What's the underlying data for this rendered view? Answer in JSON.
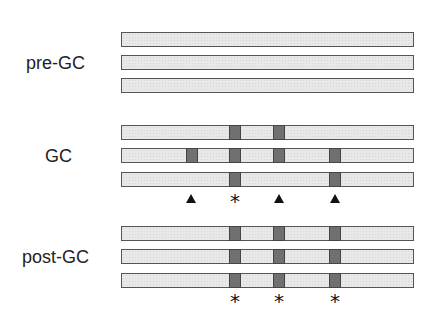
{
  "diagram": {
    "bar_x_range": [
      121,
      414
    ],
    "colors": {
      "bar_fill": "#e8e8e8",
      "bar_border": "#555555",
      "segment_fill": "#707070",
      "segment_border": "#444444",
      "marker": "#111111"
    },
    "groups": [
      {
        "label": "pre-GC",
        "label_pos": {
          "x": 26,
          "y": 53
        },
        "rows": [
          {
            "y": 32,
            "segments": []
          },
          {
            "y": 55,
            "segments": []
          },
          {
            "y": 78,
            "segments": []
          }
        ],
        "markers": []
      },
      {
        "label": "GC",
        "label_pos": {
          "x": 45,
          "y": 146
        },
        "rows": [
          {
            "y": 125,
            "segments": [
              229,
              273
            ]
          },
          {
            "y": 148,
            "segments": [
              186,
              229,
              273,
              329
            ]
          },
          {
            "y": 172,
            "segments": [
              229,
              329
            ]
          }
        ],
        "markers": [
          {
            "type": "triangle",
            "x": 191,
            "y": 194,
            "symbol": "▲"
          },
          {
            "type": "asterisk",
            "x": 235,
            "y": 193,
            "symbol": "*"
          },
          {
            "type": "triangle",
            "x": 279,
            "y": 194,
            "symbol": "▲"
          },
          {
            "type": "triangle",
            "x": 335,
            "y": 194,
            "symbol": "▲"
          }
        ]
      },
      {
        "label": "post-GC",
        "label_pos": {
          "x": 22,
          "y": 247
        },
        "rows": [
          {
            "y": 226,
            "segments": [
              229,
              273,
              329
            ]
          },
          {
            "y": 249,
            "segments": [
              229,
              273,
              329
            ]
          },
          {
            "y": 273,
            "segments": [
              229,
              273,
              329
            ]
          }
        ],
        "markers": [
          {
            "type": "asterisk",
            "x": 235,
            "y": 293,
            "symbol": "*"
          },
          {
            "type": "asterisk",
            "x": 279,
            "y": 293,
            "symbol": "*"
          },
          {
            "type": "asterisk",
            "x": 335,
            "y": 293,
            "symbol": "*"
          }
        ]
      }
    ]
  }
}
